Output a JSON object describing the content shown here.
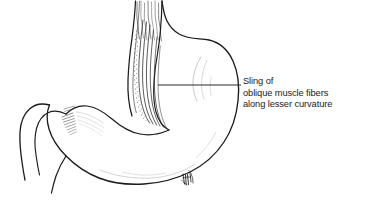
{
  "figure": {
    "title": "Sling of oblique muscle fibers along lesser curvature",
    "background_color": "#ffffff",
    "ink_color": "#1b1b1b",
    "width": 365,
    "height": 218
  },
  "annotation": {
    "lines": [
      "Sling of",
      "oblique muscle fibers",
      "along lesser curvature"
    ],
    "leader": {
      "x_start": 158,
      "x_end": 241,
      "y": 85,
      "color": "#2a2a2a"
    }
  },
  "anatomy": {
    "parts": [
      {
        "name": "esophagus",
        "label": "esophagus"
      },
      {
        "name": "gastric-fundus",
        "label": "fundus"
      },
      {
        "name": "gastric-body",
        "label": "body"
      },
      {
        "name": "lesser-curvature",
        "label": "lesser curvature"
      },
      {
        "name": "greater-curvature",
        "label": "greater curvature"
      },
      {
        "name": "oblique-muscle-sling",
        "label": "sling of oblique muscle fibers"
      },
      {
        "name": "pyloric-antrum",
        "label": "pyloric antrum"
      },
      {
        "name": "pylorus",
        "label": "pylorus"
      },
      {
        "name": "duodenum",
        "label": "duodenum"
      }
    ]
  },
  "signature": {
    "present": true,
    "position": "greater-curvature-lower-right"
  }
}
